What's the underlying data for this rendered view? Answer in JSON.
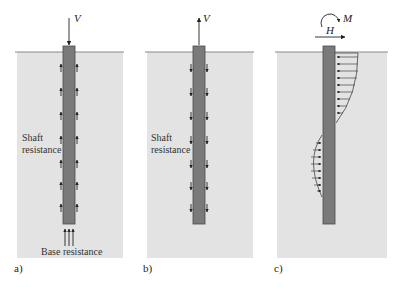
{
  "figure": {
    "colors": {
      "soil": "#e3e3e3",
      "ground_line": "#8a8a8a",
      "pile_fill": "#7a7a7a",
      "pile_stroke": "#4a4a4a",
      "arrow": "#222222",
      "background": "#ffffff"
    },
    "panels": [
      {
        "id": "a",
        "label": "a)",
        "load_symbol": "V",
        "load_direction": "down",
        "shaft_label_line1": "Shaft",
        "shaft_label_line2": "resistance",
        "base_label": "Base resistance",
        "shaft_arrow_direction": "up"
      },
      {
        "id": "b",
        "label": "b)",
        "load_symbol": "V",
        "load_direction": "up",
        "shaft_label_line1": "Shaft",
        "shaft_label_line2": "resistance",
        "shaft_arrow_direction": "down"
      },
      {
        "id": "c",
        "label": "c)",
        "moment_symbol": "M",
        "horizontal_symbol": "H",
        "load_direction": "right",
        "pressure_distribution": "upper right side pushing left, lower left side pushing right"
      }
    ]
  }
}
